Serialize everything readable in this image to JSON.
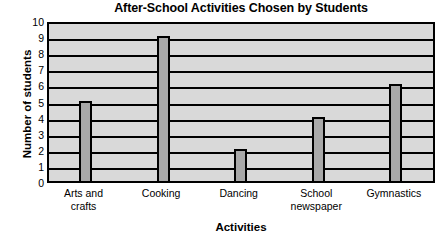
{
  "chart_data": {
    "type": "bar",
    "title": "After-School Activities Chosen by Students",
    "xlabel": "Activities",
    "ylabel": "Number of students",
    "categories": [
      "Arts and crafts",
      "Cooking",
      "Dancing",
      "School newspaper",
      "Gymnastics"
    ],
    "category_lines": [
      [
        "Arts and",
        "crafts"
      ],
      [
        "Cooking",
        ""
      ],
      [
        "Dancing",
        ""
      ],
      [
        "School",
        "newspaper"
      ],
      [
        "Gymnastics",
        ""
      ]
    ],
    "values": [
      5,
      9,
      2,
      4,
      6
    ],
    "ylim": [
      0,
      10
    ],
    "ytick_labels": [
      "0",
      "1",
      "2",
      "3",
      "4",
      "5",
      "6",
      "7",
      "8",
      "9",
      "10"
    ],
    "ytick_values": [
      0,
      1,
      2,
      3,
      4,
      5,
      6,
      7,
      8,
      9,
      10
    ],
    "grid": true,
    "legend": null,
    "colors": {
      "bar_fill": "#a8a8a8",
      "bar_edge": "#000000",
      "plot_background": "#d9d9d9",
      "gridline": "#000000",
      "text": "#000000",
      "page_background": "#ffffff"
    }
  }
}
